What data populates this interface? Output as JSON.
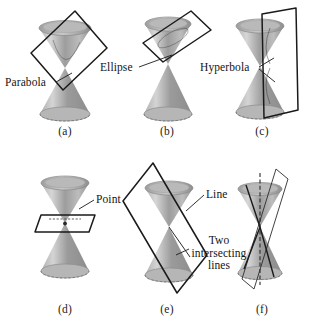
{
  "figure": {
    "stroke_color": "#1a1a1a",
    "cone_light": "#d8d8d8",
    "cone_mid": "#a8a8a8",
    "cone_dark": "#8e8e8e",
    "text_color": "#141414",
    "background": "#ffffff"
  },
  "panels": [
    {
      "id": "a",
      "caption": "(a)",
      "label": "Parabola",
      "section_type": "parabola",
      "description": "plane parallel to one generator cutting a single nappe"
    },
    {
      "id": "b",
      "caption": "(b)",
      "label": "Ellipse",
      "section_type": "ellipse",
      "description": "plane cutting one nappe obliquely in a closed curve"
    },
    {
      "id": "c",
      "caption": "(c)",
      "label": "Hyperbola",
      "section_type": "hyperbola",
      "description": "vertical plane cutting both nappes"
    },
    {
      "id": "d",
      "caption": "(d)",
      "label": "Point",
      "section_type": "point",
      "description": "horizontal plane through the apex"
    },
    {
      "id": "e",
      "caption": "(e)",
      "label": "Line",
      "section_type": "line",
      "description": "plane tangent to the cone along one generator"
    },
    {
      "id": "f",
      "caption": "(f)",
      "label_lines": [
        "Two",
        "intersecting",
        "lines"
      ],
      "label": "Two intersecting lines",
      "section_type": "two-intersecting-lines",
      "description": "vertical plane through the apex"
    }
  ]
}
